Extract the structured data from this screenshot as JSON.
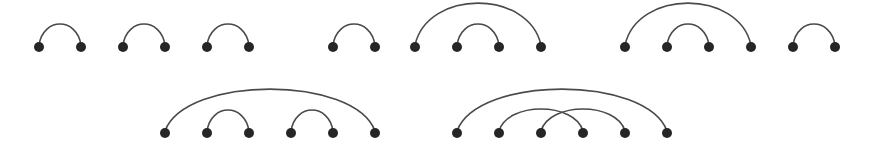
{
  "diagram": {
    "type": "arc-diagram",
    "colors": {
      "arc": "#4a4a4a",
      "dot": "#262626",
      "background": "#ffffff"
    },
    "dot_radius": 5,
    "groups": [
      {
        "id": "g1",
        "row": 1,
        "baseline": 47,
        "points": [
          39,
          81
        ],
        "arcs": [
          [
            0,
            1,
            21
          ]
        ]
      },
      {
        "id": "g2",
        "row": 1,
        "baseline": 47,
        "points": [
          123,
          165
        ],
        "arcs": [
          [
            0,
            1,
            21
          ]
        ]
      },
      {
        "id": "g3",
        "row": 1,
        "baseline": 47,
        "points": [
          207,
          249
        ],
        "arcs": [
          [
            0,
            1,
            21
          ]
        ]
      },
      {
        "id": "g4",
        "row": 1,
        "baseline": 47,
        "points": [
          333,
          375
        ],
        "arcs": [
          [
            0,
            1,
            21
          ]
        ]
      },
      {
        "id": "g5",
        "row": 1,
        "baseline": 47,
        "points": [
          415,
          457,
          499,
          541
        ],
        "arcs": [
          [
            0,
            3,
            42
          ],
          [
            1,
            2,
            21
          ]
        ]
      },
      {
        "id": "g6",
        "row": 1,
        "baseline": 47,
        "points": [
          625,
          667,
          709,
          751
        ],
        "arcs": [
          [
            0,
            3,
            42
          ],
          [
            1,
            2,
            21
          ]
        ]
      },
      {
        "id": "g7",
        "row": 1,
        "baseline": 47,
        "points": [
          793,
          835
        ],
        "arcs": [
          [
            0,
            1,
            21
          ]
        ]
      },
      {
        "id": "g8",
        "row": 2,
        "baseline": 133,
        "points": [
          165,
          207,
          249,
          291,
          333,
          375
        ],
        "arcs": [
          [
            0,
            5,
            42
          ],
          [
            1,
            2,
            21
          ],
          [
            3,
            4,
            21
          ]
        ]
      },
      {
        "id": "g9",
        "row": 2,
        "baseline": 133,
        "points": [
          457,
          499,
          541,
          583,
          625,
          667
        ],
        "arcs": [
          [
            0,
            5,
            42
          ],
          [
            1,
            3,
            22
          ],
          [
            2,
            4,
            22
          ]
        ]
      }
    ]
  }
}
